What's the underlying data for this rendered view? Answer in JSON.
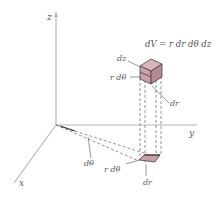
{
  "figure": {
    "formula": "dV = r dr dθ dz",
    "axes": {
      "z": "z",
      "y": "y",
      "x": "x"
    },
    "volume_element_labels": {
      "dz": "dz",
      "r_dtheta": "r dθ",
      "dr": "dr"
    },
    "base_element_labels": {
      "dtheta": "dθ",
      "r_dtheta": "r dθ",
      "dr": "dr"
    },
    "colors": {
      "element_fill": "#c9a0a8",
      "element_top": "#d9b4bb",
      "element_side": "#b88890",
      "axis": "#b8b8b8"
    }
  }
}
